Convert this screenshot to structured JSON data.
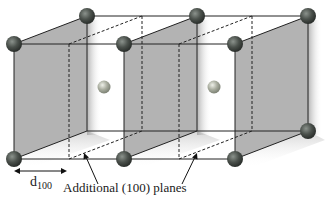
{
  "diagram": {
    "labels": {
      "spacing_main": "d",
      "spacing_sub": "100",
      "additional_planes": "Additional (100) planes"
    },
    "colors": {
      "plane_fill": "#b3b3b3",
      "plane_shadow": "#d6d6d6",
      "edge": "#222222",
      "corner_atom": "#4b514c",
      "corner_atom_highlight": "#8b928c",
      "center_atom": "#a9ad9f",
      "center_atom_highlight": "#e9ebe2"
    },
    "planes": [
      {
        "name": "plane-1",
        "front_x": 14,
        "back_x": 87
      },
      {
        "name": "plane-2",
        "front_x": 124,
        "back_x": 197
      },
      {
        "name": "plane-3",
        "front_x": 235,
        "back_x": 308
      }
    ],
    "additional_planes": [
      {
        "name": "additional-plane-1",
        "front_x": 69,
        "back_x": 142
      },
      {
        "name": "additional-plane-2",
        "front_x": 179,
        "back_x": 252
      }
    ],
    "geometry": {
      "front_top_y": 44,
      "front_bottom_y": 159,
      "back_top_y": 16,
      "back_bottom_y": 131
    },
    "center_atoms": [
      {
        "x": 104,
        "y": 87
      },
      {
        "x": 214,
        "y": 87
      }
    ]
  }
}
